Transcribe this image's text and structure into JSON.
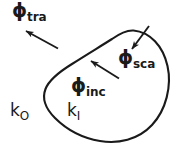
{
  "figure": {
    "type": "scattering-geometry-diagram",
    "background_color": "#ffffff",
    "stroke_color": "#1a1a1a",
    "labels": {
      "transmitted": {
        "symbol": "ϕ",
        "subscript": "tra"
      },
      "scattered": {
        "symbol": "ϕ",
        "subscript": "sca"
      },
      "incident": {
        "symbol": "ϕ",
        "subscript": "inc"
      },
      "wavenumber_outside": {
        "symbol": "k",
        "subscript": "O"
      },
      "wavenumber_inside": {
        "symbol": "k",
        "subscript": "I"
      }
    },
    "arrows": [
      {
        "name": "transmitted-arrow",
        "direction": "up-left"
      },
      {
        "name": "scattered-arrow",
        "direction": "down-left"
      },
      {
        "name": "incident-arrow",
        "direction": "up-left"
      }
    ],
    "shape": {
      "name": "scatterer-boundary",
      "kind": "closed-irregular-blob"
    }
  }
}
